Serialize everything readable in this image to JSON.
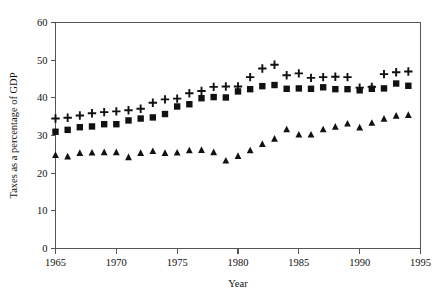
{
  "chart_data": {
    "type": "scatter",
    "title": "",
    "xlabel": "Year",
    "ylabel": "Taxes as a percentage of GDP",
    "xlim": [
      1965,
      1995
    ],
    "ylim": [
      0,
      60
    ],
    "xticks": [
      1965,
      1970,
      1975,
      1980,
      1985,
      1990,
      1995
    ],
    "yticks": [
      0,
      10,
      20,
      30,
      40,
      50,
      60
    ],
    "grid": false,
    "legend": "none",
    "x": [
      1965,
      1966,
      1967,
      1968,
      1969,
      1970,
      1971,
      1972,
      1973,
      1974,
      1975,
      1976,
      1977,
      1978,
      1979,
      1980,
      1981,
      1982,
      1983,
      1984,
      1985,
      1986,
      1987,
      1988,
      1989,
      1990,
      1991,
      1992,
      1993,
      1994
    ],
    "series": [
      {
        "name": "plus-series",
        "marker": "plus",
        "values": [
          34.5,
          34.7,
          35.3,
          35.9,
          36.2,
          36.4,
          36.7,
          37.1,
          38.7,
          39.6,
          39.8,
          41.2,
          41.8,
          42.9,
          43.0,
          43.0,
          45.5,
          47.8,
          48.8,
          46.0,
          46.5,
          45.3,
          45.5,
          45.6,
          45.5,
          42.7,
          42.9,
          46.3,
          46.8,
          47.0
        ]
      },
      {
        "name": "square-series",
        "marker": "square",
        "values": [
          31.0,
          31.5,
          32.2,
          32.4,
          33.0,
          33.0,
          34.0,
          34.5,
          34.8,
          35.7,
          37.7,
          38.3,
          39.9,
          40.2,
          40.1,
          41.7,
          42.3,
          43.1,
          43.4,
          42.4,
          42.5,
          42.4,
          42.8,
          42.3,
          42.3,
          42.0,
          42.4,
          42.5,
          43.8,
          43.2
        ]
      },
      {
        "name": "triangle-series",
        "marker": "triangle",
        "values": [
          24.8,
          24.4,
          25.3,
          25.4,
          25.5,
          25.5,
          24.2,
          25.3,
          25.8,
          25.3,
          25.4,
          26.0,
          26.1,
          25.5,
          23.3,
          24.5,
          26.0,
          27.7,
          29.1,
          31.6,
          30.2,
          30.2,
          31.6,
          32.3,
          33.1,
          32.1,
          33.3,
          34.4,
          35.2,
          35.4
        ]
      }
    ]
  }
}
